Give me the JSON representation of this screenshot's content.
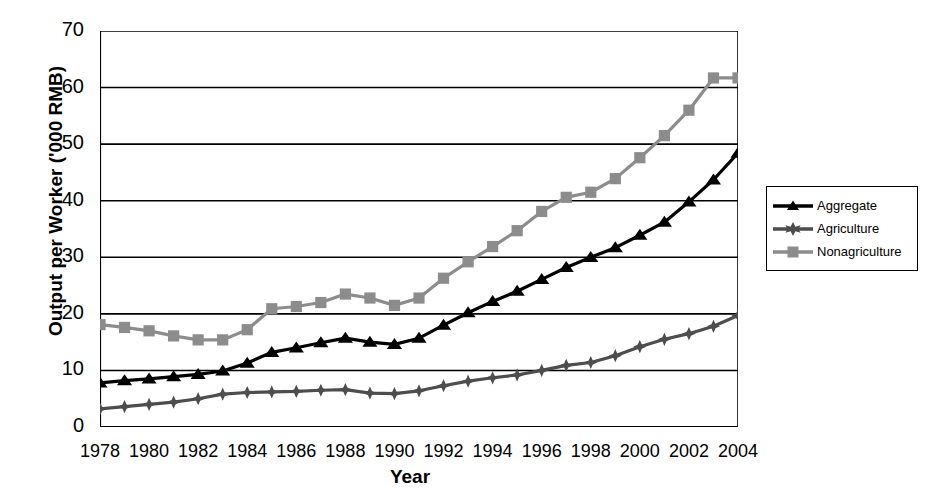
{
  "chart_data": {
    "type": "line",
    "title": "",
    "xlabel": "Year",
    "ylabel": "Output per Worker ('000 RMB)",
    "xlim": [
      1978,
      2004
    ],
    "ylim": [
      0,
      70
    ],
    "ytick_step": 10,
    "xtick_step": 1,
    "xtick_label_step": 2,
    "grid": "horizontal",
    "legend_position": "right",
    "yticks": [
      "0",
      "10",
      "20",
      "30",
      "40",
      "50",
      "60",
      "70"
    ],
    "ytick_values": [
      0,
      10,
      20,
      30,
      40,
      50,
      60,
      70
    ],
    "xticks": [
      "1978",
      "1980",
      "1982",
      "1984",
      "1986",
      "1988",
      "1990",
      "1992",
      "1994",
      "1996",
      "1998",
      "2000",
      "2002",
      "2004"
    ],
    "xtick_values": [
      1978,
      1980,
      1982,
      1984,
      1986,
      1988,
      1990,
      1992,
      1994,
      1996,
      1998,
      2000,
      2002,
      2004
    ],
    "x": [
      1978,
      1979,
      1980,
      1981,
      1982,
      1983,
      1984,
      1985,
      1986,
      1987,
      1988,
      1989,
      1990,
      1991,
      1992,
      1993,
      1994,
      1995,
      1996,
      1997,
      1998,
      1999,
      2000,
      2001,
      2002,
      2003,
      2004
    ],
    "series": [
      {
        "name": "Aggregate",
        "color": "#000000",
        "marker": "triangle",
        "values": [
          7.8,
          8.2,
          8.5,
          8.9,
          9.3,
          9.9,
          11.3,
          13.2,
          14.0,
          14.9,
          15.7,
          15.0,
          14.6,
          15.7,
          18.0,
          20.2,
          22.2,
          24.0,
          26.1,
          28.2,
          30.0,
          31.7,
          33.9,
          36.2,
          39.8,
          43.7,
          48.4
        ]
      },
      {
        "name": "Agriculture",
        "color": "#4d4d4d",
        "marker": "star",
        "values": [
          3.2,
          3.6,
          4.0,
          4.4,
          5.0,
          5.8,
          6.1,
          6.2,
          6.3,
          6.5,
          6.6,
          6.0,
          5.9,
          6.4,
          7.3,
          8.1,
          8.7,
          9.2,
          10.0,
          10.9,
          11.4,
          12.6,
          14.2,
          15.5,
          16.5,
          17.8,
          19.7
        ]
      },
      {
        "name": "Nonagriculture",
        "color": "#8c8c8c",
        "marker": "square",
        "values": [
          18.1,
          17.6,
          17.0,
          16.1,
          15.4,
          15.4,
          17.2,
          20.9,
          21.3,
          22.0,
          23.5,
          22.8,
          21.5,
          22.8,
          26.3,
          29.2,
          31.9,
          34.7,
          38.1,
          40.6,
          41.5,
          43.9,
          47.6,
          51.5,
          56.0,
          61.7,
          61.7
        ]
      }
    ]
  },
  "legend": {
    "items": [
      {
        "label": "Aggregate"
      },
      {
        "label": "Agriculture"
      },
      {
        "label": "Nonagriculture"
      }
    ]
  }
}
